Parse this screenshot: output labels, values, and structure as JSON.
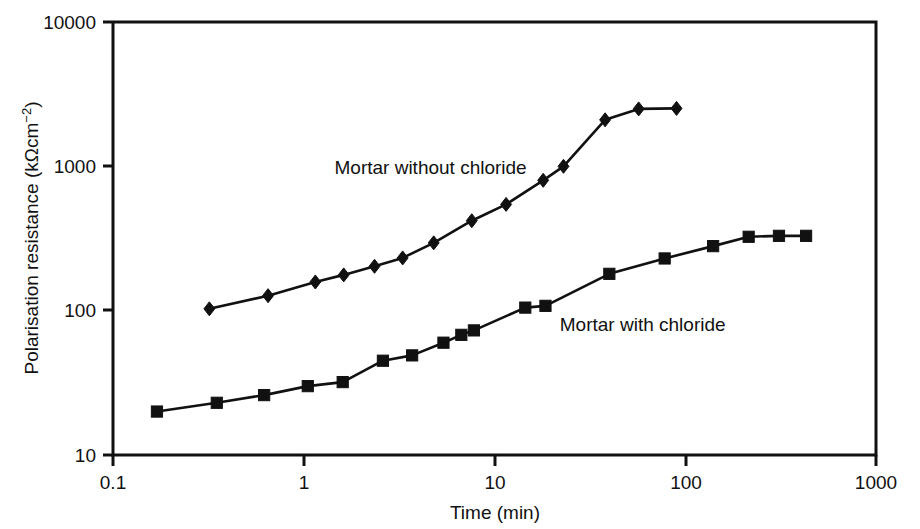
{
  "chart_data": {
    "type": "line",
    "title": "",
    "xlabel": "Time (min)",
    "ylabel": "Polarisation resistance (kΩcm⁻²)",
    "xscale": "log",
    "yscale": "log",
    "xlim": [
      0.1,
      1000
    ],
    "ylim": [
      10,
      10000
    ],
    "xticks": [
      0.1,
      1,
      10,
      100,
      1000
    ],
    "xtick_labels": [
      "0.1",
      "1",
      "10",
      "100",
      "1000"
    ],
    "yticks": [
      10,
      100,
      1000,
      10000
    ],
    "ytick_labels": [
      "10",
      "100",
      "1000",
      "10000"
    ],
    "grid": false,
    "legend_position": "inline-annotation",
    "series": [
      {
        "name": "Mortar without chloride",
        "marker": "diamond",
        "color": "#111111",
        "label_x": 1.45,
        "label_y": 880,
        "points": [
          [
            0.32,
            103
          ],
          [
            0.65,
            127
          ],
          [
            1.15,
            158
          ],
          [
            1.62,
            177
          ],
          [
            2.35,
            203
          ],
          [
            3.3,
            232
          ],
          [
            4.8,
            295
          ],
          [
            7.6,
            420
          ],
          [
            11.5,
            545
          ],
          [
            18.0,
            800
          ],
          [
            23.0,
            1000
          ],
          [
            38.0,
            2100
          ],
          [
            57.0,
            2500
          ],
          [
            90.0,
            2520
          ]
        ]
      },
      {
        "name": "Mortar with chloride",
        "marker": "square",
        "color": "#111111",
        "label_x": 22.0,
        "label_y": 72,
        "points": [
          [
            0.17,
            20
          ],
          [
            0.35,
            23
          ],
          [
            0.62,
            26
          ],
          [
            1.05,
            30
          ],
          [
            1.6,
            32
          ],
          [
            2.6,
            45
          ],
          [
            3.7,
            49
          ],
          [
            5.4,
            60
          ],
          [
            6.7,
            68
          ],
          [
            7.8,
            73
          ],
          [
            14.5,
            105
          ],
          [
            18.5,
            108
          ],
          [
            40.0,
            180
          ],
          [
            78.0,
            230
          ],
          [
            140.0,
            280
          ],
          [
            215.0,
            325
          ],
          [
            310.0,
            330
          ],
          [
            430.0,
            330
          ]
        ]
      }
    ]
  },
  "labels": {
    "series_without_chloride": "Mortar without chloride",
    "series_with_chloride": "Mortar with chloride"
  }
}
